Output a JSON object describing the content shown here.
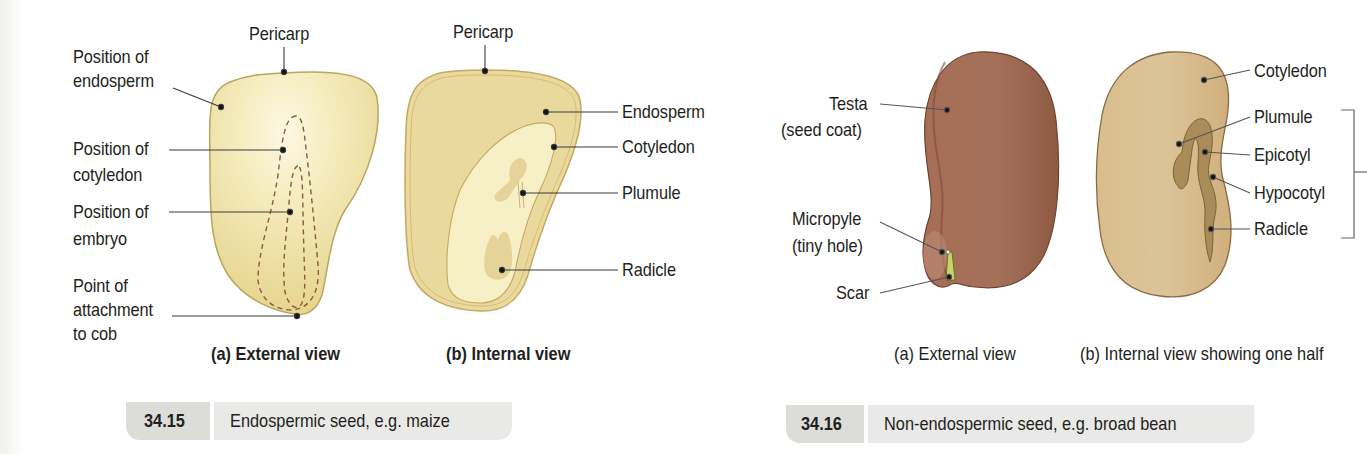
{
  "figures": [
    {
      "number": "34.15",
      "caption": "Endospermic seed, e.g. maize",
      "views": [
        {
          "title": "(a) External view",
          "labels": [
            {
              "text": "Pericarp"
            },
            {
              "text": "Position of"
            },
            {
              "text": "endosperm"
            },
            {
              "text": "Position of"
            },
            {
              "text": "cotyledon"
            },
            {
              "text": "Position of"
            },
            {
              "text": "embryo"
            },
            {
              "text": "Point of"
            },
            {
              "text": "attachment"
            },
            {
              "text": "to cob"
            }
          ]
        },
        {
          "title": "(b) Internal view",
          "labels": [
            {
              "text": "Pericarp"
            },
            {
              "text": "Endosperm"
            },
            {
              "text": "Cotyledon"
            },
            {
              "text": "Plumule"
            },
            {
              "text": "Radicle"
            }
          ]
        }
      ]
    },
    {
      "number": "34.16",
      "caption": "Non-endospermic seed, e.g. broad bean",
      "views": [
        {
          "title": "(a) External view",
          "labels": [
            {
              "text": "Testa"
            },
            {
              "text": "(seed coat)"
            },
            {
              "text": "Micropyle"
            },
            {
              "text": "(tiny hole)"
            },
            {
              "text": "Scar"
            }
          ]
        },
        {
          "title": "(b) Internal view showing one half",
          "labels": [
            {
              "text": "Cotyledon"
            },
            {
              "text": "Plumule"
            },
            {
              "text": "Epicotyl"
            },
            {
              "text": "Hypocotyl"
            },
            {
              "text": "Radicle"
            }
          ]
        }
      ]
    }
  ],
  "colors": {
    "maize_outer": "#efe3a6",
    "maize_highlight": "#fbf6dc",
    "maize_outline": "#b5a35a",
    "maize_dash": "#8c5a3c",
    "endosperm_fill": "#e8d79a",
    "cotyledon_fill": "#f8f0c8",
    "bean_testa": "#9c6248",
    "bean_inner": "#d7b886",
    "embryo_fill": "#a68a55",
    "caption_num_bg": "#dcdcd9",
    "caption_text_bg": "#e9e9e7"
  }
}
